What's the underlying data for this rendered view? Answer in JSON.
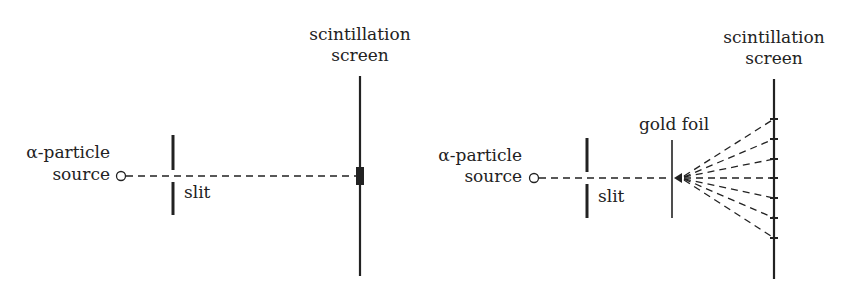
{
  "left_diagram": {
    "source_label_line1": "α-particle",
    "source_label_line2": "source",
    "slit_label": "slit",
    "screen_label_line1": "scintillation",
    "screen_label_line2": "screen"
  },
  "right_diagram": {
    "source_label_line1": "α-particle",
    "source_label_line2": "source",
    "slit_label": "slit",
    "foil_label": "gold foil",
    "screen_label_line1": "scintillation",
    "screen_label_line2": "screen",
    "scatter_hit_y": [
      119,
      139,
      159,
      178,
      198,
      218,
      238
    ]
  },
  "colors": {
    "ink": "#222222",
    "background": "#ffffff"
  }
}
